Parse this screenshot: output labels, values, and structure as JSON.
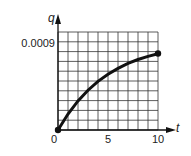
{
  "chart_data": {
    "type": "line",
    "title": "",
    "xlabel": "t",
    "ylabel": "q",
    "xlim": [
      0,
      10
    ],
    "ylim": [
      0,
      0.001
    ],
    "grid": true,
    "grid_divisions": {
      "x": 10,
      "y": 10
    },
    "x_ticks": [
      "0",
      "5",
      "10"
    ],
    "y_ticks": [
      "0.0009"
    ],
    "series": [
      {
        "name": "q(t)",
        "x": [
          0,
          1,
          2,
          3,
          4,
          5,
          6,
          7,
          8,
          9,
          10
        ],
        "values": [
          0,
          0.000163,
          0.000297,
          0.000406,
          0.000496,
          0.000569,
          0.000629,
          0.000679,
          0.000719,
          0.000751,
          0.000778
        ]
      }
    ],
    "endpoints": [
      {
        "x": 0,
        "y": 0
      },
      {
        "x": 10,
        "y": 0.00078
      }
    ],
    "color": "#111111"
  },
  "labels": {
    "y_axis": "q",
    "x_axis": "t",
    "y_tick_0009": "0.0009",
    "x_tick_0": "0",
    "x_tick_5": "5",
    "x_tick_10": "10"
  }
}
